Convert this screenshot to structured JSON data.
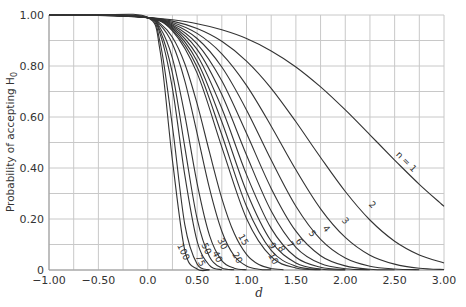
{
  "chart_data": {
    "type": "line",
    "title": "",
    "xlabel": "d",
    "ylabel": "Probability of accepting H",
    "ylabel_subscript": "0",
    "xlim": [
      -1.0,
      3.0
    ],
    "ylim": [
      0,
      1.0
    ],
    "grid": true,
    "x_grid_step": 0.25,
    "y_grid_step": 0.1,
    "x_ticks": [
      {
        "v": -1.0,
        "label": "-1.00"
      },
      {
        "v": -0.5,
        "label": "-0.50"
      },
      {
        "v": 0.0,
        "label": "0.0"
      },
      {
        "v": 0.5,
        "label": "0.50"
      },
      {
        "v": 1.0,
        "label": "1.00"
      },
      {
        "v": 1.5,
        "label": "1.50"
      },
      {
        "v": 2.0,
        "label": "2.00"
      },
      {
        "v": 2.5,
        "label": "2.50"
      },
      {
        "v": 3.0,
        "label": "3.00"
      }
    ],
    "y_ticks": [
      {
        "v": 0,
        "label": "0"
      },
      {
        "v": 0.2,
        "label": "0.20"
      },
      {
        "v": 0.4,
        "label": "0.40"
      },
      {
        "v": 0.6,
        "label": "0.60"
      },
      {
        "v": 0.8,
        "label": "0.80"
      },
      {
        "v": 1.0,
        "label": "1.00"
      }
    ],
    "legend": "none (curves labeled inline)",
    "series": [
      {
        "name": "n = 1",
        "label": "n = 1",
        "lx": 406,
        "ly": 162,
        "rot": 45,
        "x": [
          -1,
          -0.5,
          0,
          0.25,
          0.5,
          0.75,
          1,
          1.25,
          1.5,
          1.75,
          2,
          2.25,
          2.5,
          2.75,
          3
        ],
        "y": [
          1.0,
          0.998,
          0.99,
          0.981,
          0.966,
          0.942,
          0.908,
          0.859,
          0.796,
          0.718,
          0.628,
          0.53,
          0.431,
          0.336,
          0.25
        ]
      },
      {
        "name": "n = 2",
        "label": "2",
        "lx": 372,
        "ly": 205,
        "rot": 45,
        "x": [
          -1,
          -0.5,
          0,
          0.25,
          0.5,
          0.75,
          1,
          1.25,
          1.5,
          1.75,
          2,
          2.25,
          2.5,
          2.75,
          3
        ],
        "y": [
          1.0,
          0.999,
          0.99,
          0.976,
          0.947,
          0.897,
          0.819,
          0.712,
          0.581,
          0.441,
          0.308,
          0.196,
          0.113,
          0.059,
          0.028
        ]
      },
      {
        "name": "n = 3",
        "label": "3",
        "lx": 345,
        "ly": 221,
        "rot": 50,
        "x": [
          -1,
          -0.5,
          0,
          0.25,
          0.5,
          0.75,
          1,
          1.25,
          1.5,
          1.75,
          2,
          2.25,
          2.5,
          2.75,
          3
        ],
        "y": [
          1.0,
          1.0,
          0.99,
          0.971,
          0.928,
          0.848,
          0.724,
          0.564,
          0.393,
          0.24,
          0.128,
          0.058,
          0.023,
          0.007,
          0.002
        ]
      },
      {
        "name": "n = 4",
        "label": "4",
        "lx": 326,
        "ly": 229,
        "rot": 50,
        "x": [
          -1,
          -0.5,
          0,
          0.25,
          0.5,
          0.75,
          1,
          1.25,
          1.5,
          1.75,
          2,
          2.25,
          2.5,
          2.75
        ],
        "y": [
          1.0,
          1.0,
          0.99,
          0.966,
          0.908,
          0.796,
          0.628,
          0.431,
          0.25,
          0.12,
          0.047,
          0.015,
          0.004,
          0.001
        ]
      },
      {
        "name": "n = 5",
        "label": "5",
        "lx": 312,
        "ly": 234,
        "rot": 55,
        "x": [
          -1,
          -0.5,
          0,
          0.25,
          0.5,
          0.75,
          1,
          1.25,
          1.5,
          1.75,
          2,
          2.25,
          2.5
        ],
        "y": [
          1.0,
          1.0,
          0.99,
          0.961,
          0.887,
          0.742,
          0.536,
          0.32,
          0.152,
          0.056,
          0.016,
          0.003,
          0.001
        ]
      },
      {
        "name": "n = 6",
        "label": "6",
        "lx": 299,
        "ly": 242,
        "rot": 55,
        "x": [
          -1,
          -0.5,
          0,
          0.25,
          0.5,
          0.75,
          1,
          1.25,
          1.5,
          1.75,
          2,
          2.25
        ],
        "y": [
          1.0,
          1.0,
          0.99,
          0.957,
          0.865,
          0.688,
          0.451,
          0.231,
          0.089,
          0.025,
          0.005,
          0.001
        ]
      },
      {
        "name": "n = 7",
        "label": "7",
        "lx": 290,
        "ly": 245,
        "rot": 55,
        "x": [
          -1,
          -0.5,
          0,
          0.25,
          0.5,
          0.75,
          1,
          1.25,
          1.5,
          1.75,
          2
        ],
        "y": [
          1.0,
          1.0,
          0.99,
          0.952,
          0.842,
          0.634,
          0.374,
          0.163,
          0.05,
          0.011,
          0.002
        ]
      },
      {
        "name": "n = 8",
        "label": "8",
        "lx": 281,
        "ly": 249,
        "rot": 60,
        "x": [
          -1,
          -0.5,
          0,
          0.25,
          0.5,
          0.75,
          1,
          1.25,
          1.5,
          1.75,
          2
        ],
        "y": [
          1.0,
          1.0,
          0.99,
          0.947,
          0.819,
          0.581,
          0.308,
          0.113,
          0.028,
          0.004,
          0.0
        ]
      },
      {
        "name": "n = 9",
        "label": "9",
        "lx": 272,
        "ly": 246,
        "rot": 60,
        "x": [
          -1,
          -0.5,
          0,
          0.25,
          0.5,
          0.75,
          1,
          1.25,
          1.5,
          1.75
        ],
        "y": [
          1.0,
          1.0,
          0.99,
          0.942,
          0.796,
          0.53,
          0.25,
          0.077,
          0.015,
          0.002
        ]
      },
      {
        "name": "n = 10",
        "label": "10",
        "lx": 273,
        "ly": 259,
        "rot": 60,
        "x": [
          -1,
          -0.5,
          0,
          0.25,
          0.5,
          0.75,
          1,
          1.25,
          1.5,
          1.75
        ],
        "y": [
          1.0,
          1.0,
          0.99,
          0.938,
          0.772,
          0.482,
          0.202,
          0.052,
          0.008,
          0.001
        ]
      },
      {
        "name": "n = 15",
        "label": "15",
        "lx": 243,
        "ly": 240,
        "rot": 60,
        "x": [
          -1,
          -0.5,
          0,
          0.125,
          0.25,
          0.375,
          0.5,
          0.625,
          0.75,
          0.875,
          1,
          1.125,
          1.25,
          1.375
        ],
        "y": [
          1.0,
          1.0,
          0.99,
          0.967,
          0.913,
          0.809,
          0.652,
          0.462,
          0.281,
          0.144,
          0.061,
          0.021,
          0.006,
          0.001
        ]
      },
      {
        "name": "n = 20",
        "label": "20",
        "lx": 237,
        "ly": 258,
        "rot": 60,
        "x": [
          -1,
          -0.5,
          0,
          0.125,
          0.25,
          0.375,
          0.5,
          0.625,
          0.75,
          0.875,
          1,
          1.125,
          1.25
        ],
        "y": [
          1.0,
          1.0,
          0.99,
          0.961,
          0.887,
          0.742,
          0.536,
          0.32,
          0.152,
          0.056,
          0.016,
          0.003,
          0.001
        ]
      },
      {
        "name": "n = 30",
        "label": "30",
        "lx": 222,
        "ly": 244,
        "rot": 65,
        "x": [
          -1,
          -0.5,
          0,
          0.125,
          0.25,
          0.375,
          0.5,
          0.625,
          0.75,
          0.875,
          1
        ],
        "y": [
          1.0,
          1.0,
          0.99,
          0.95,
          0.831,
          0.607,
          0.34,
          0.136,
          0.037,
          0.007,
          0.001
        ]
      },
      {
        "name": "n = 40",
        "label": "40",
        "lx": 217,
        "ly": 257,
        "rot": 65,
        "x": [
          -1,
          -0.5,
          0,
          0.125,
          0.25,
          0.375,
          0.5,
          0.625,
          0.75,
          0.875
        ],
        "y": [
          1.0,
          1.0,
          0.99,
          0.938,
          0.772,
          0.482,
          0.201,
          0.052,
          0.008,
          0.001
        ]
      },
      {
        "name": "n = 50",
        "label": "50",
        "lx": 206,
        "ly": 249,
        "rot": 65,
        "x": [
          -1,
          -0.5,
          0,
          0.125,
          0.25,
          0.375,
          0.5,
          0.625,
          0.75
        ],
        "y": [
          1.0,
          1.0,
          0.99,
          0.925,
          0.712,
          0.372,
          0.113,
          0.018,
          0.001
        ]
      },
      {
        "name": "n = 75",
        "label": "75",
        "lx": 200,
        "ly": 261,
        "rot": 65,
        "x": [
          -1,
          -0.5,
          0,
          0.125,
          0.25,
          0.375,
          0.5,
          0.625
        ],
        "y": [
          1.0,
          1.0,
          0.99,
          0.893,
          0.564,
          0.178,
          0.023,
          0.001
        ]
      },
      {
        "name": "n = 100",
        "label": "100",
        "lx": 183,
        "ly": 252,
        "rot": 65,
        "x": [
          -1,
          -0.5,
          0,
          0.125,
          0.25,
          0.375,
          0.5,
          0.625
        ],
        "y": [
          1.0,
          1.0,
          0.99,
          0.859,
          0.431,
          0.077,
          0.004,
          0.0
        ]
      }
    ]
  }
}
